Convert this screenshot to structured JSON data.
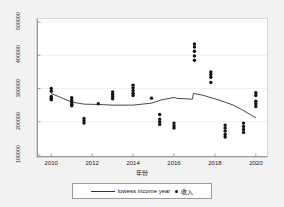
{
  "chart_data": {
    "type": "scatter",
    "title": "",
    "xlabel": "年份",
    "ylabel": "",
    "xlim": [
      2009.4,
      2020.4
    ],
    "ylim": [
      100000,
      500000
    ],
    "grid": true,
    "legend_position": "bottom-center",
    "x_ticks": [
      2010,
      2012,
      2014,
      2016,
      2018,
      2020
    ],
    "x_tick_labels": [
      "2010",
      "2012",
      "2014",
      "2016",
      "2018",
      "2020"
    ],
    "y_ticks": [
      100000,
      200000,
      300000,
      400000,
      500000
    ],
    "y_tick_labels": [
      "100000",
      "200000",
      "300000",
      "400000",
      "500000"
    ],
    "series": [
      {
        "name": "收入",
        "type": "scatter",
        "marker": "circle",
        "color": "#111111",
        "points": [
          {
            "x": 2010.0,
            "y": 300000
          },
          {
            "x": 2010.0,
            "y": 292000
          },
          {
            "x": 2010.0,
            "y": 276000
          },
          {
            "x": 2010.0,
            "y": 271000
          },
          {
            "x": 2010.0,
            "y": 266000
          },
          {
            "x": 2011.0,
            "y": 272000
          },
          {
            "x": 2011.0,
            "y": 265000
          },
          {
            "x": 2011.0,
            "y": 259000
          },
          {
            "x": 2011.0,
            "y": 253000
          },
          {
            "x": 2011.0,
            "y": 248000
          },
          {
            "x": 2011.6,
            "y": 210000
          },
          {
            "x": 2011.6,
            "y": 203000
          },
          {
            "x": 2011.6,
            "y": 196000
          },
          {
            "x": 2012.3,
            "y": 254000
          },
          {
            "x": 2013.0,
            "y": 290000
          },
          {
            "x": 2013.0,
            "y": 283000
          },
          {
            "x": 2013.0,
            "y": 276000
          },
          {
            "x": 2013.0,
            "y": 269000
          },
          {
            "x": 2014.0,
            "y": 310000
          },
          {
            "x": 2014.0,
            "y": 302000
          },
          {
            "x": 2014.0,
            "y": 294000
          },
          {
            "x": 2014.0,
            "y": 286000
          },
          {
            "x": 2014.0,
            "y": 279000
          },
          {
            "x": 2014.9,
            "y": 271000
          },
          {
            "x": 2015.3,
            "y": 222000
          },
          {
            "x": 2015.3,
            "y": 208000
          },
          {
            "x": 2015.3,
            "y": 200000
          },
          {
            "x": 2015.3,
            "y": 192000
          },
          {
            "x": 2016.0,
            "y": 196000
          },
          {
            "x": 2016.0,
            "y": 188000
          },
          {
            "x": 2016.0,
            "y": 181000
          },
          {
            "x": 2017.0,
            "y": 434000
          },
          {
            "x": 2017.0,
            "y": 425000
          },
          {
            "x": 2017.0,
            "y": 412000
          },
          {
            "x": 2017.0,
            "y": 398000
          },
          {
            "x": 2017.0,
            "y": 385000
          },
          {
            "x": 2017.8,
            "y": 350000
          },
          {
            "x": 2017.8,
            "y": 342000
          },
          {
            "x": 2017.8,
            "y": 334000
          },
          {
            "x": 2017.8,
            "y": 318000
          },
          {
            "x": 2018.5,
            "y": 190000
          },
          {
            "x": 2018.5,
            "y": 181000
          },
          {
            "x": 2018.5,
            "y": 172000
          },
          {
            "x": 2018.5,
            "y": 162000
          },
          {
            "x": 2018.5,
            "y": 154000
          },
          {
            "x": 2019.4,
            "y": 196000
          },
          {
            "x": 2019.4,
            "y": 186000
          },
          {
            "x": 2019.4,
            "y": 177000
          },
          {
            "x": 2019.4,
            "y": 168000
          },
          {
            "x": 2020.0,
            "y": 287000
          },
          {
            "x": 2020.0,
            "y": 279000
          },
          {
            "x": 2020.0,
            "y": 262000
          },
          {
            "x": 2020.0,
            "y": 254000
          },
          {
            "x": 2020.0,
            "y": 246000
          }
        ]
      },
      {
        "name": "lowess income year",
        "type": "line",
        "color": "#333333",
        "points": [
          {
            "x": 2010.0,
            "y": 285000
          },
          {
            "x": 2010.5,
            "y": 272000
          },
          {
            "x": 2011.0,
            "y": 259000
          },
          {
            "x": 2011.6,
            "y": 253000
          },
          {
            "x": 2012.3,
            "y": 252000
          },
          {
            "x": 2013.0,
            "y": 250000
          },
          {
            "x": 2014.0,
            "y": 250000
          },
          {
            "x": 2014.9,
            "y": 256000
          },
          {
            "x": 2015.4,
            "y": 266000
          },
          {
            "x": 2016.0,
            "y": 273000
          },
          {
            "x": 2016.2,
            "y": 270000
          },
          {
            "x": 2016.9,
            "y": 268000
          },
          {
            "x": 2016.95,
            "y": 285000
          },
          {
            "x": 2017.4,
            "y": 280000
          },
          {
            "x": 2018.2,
            "y": 265000
          },
          {
            "x": 2018.9,
            "y": 250000
          },
          {
            "x": 2019.3,
            "y": 237000
          },
          {
            "x": 2020.0,
            "y": 212000
          }
        ]
      }
    ]
  },
  "legend": {
    "line_label": "lowess income year",
    "dot_label": "收入"
  }
}
